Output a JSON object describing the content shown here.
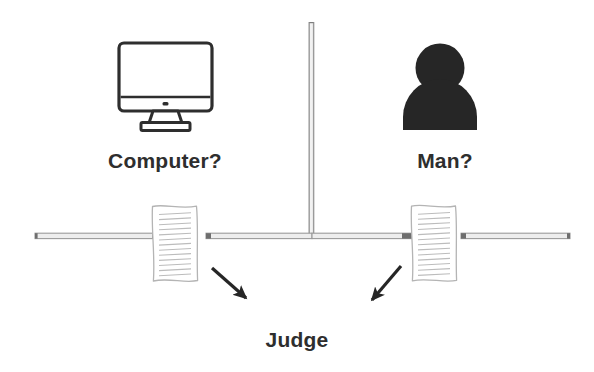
{
  "diagram": {
    "background_color": "#ffffff",
    "width": 594,
    "height": 372
  },
  "labels": {
    "computer": "Computer?",
    "man": "Man?",
    "judge": "Judge"
  },
  "colors": {
    "ink": "#2e2e2e",
    "silhouette": "#262626",
    "wall": "#9a9a9a",
    "wall_cap": "#6e6e6e",
    "paper_outline": "#b4b4b4",
    "paper_rule": "#bcbcbc",
    "arrow": "#262626",
    "background": "#ffffff"
  },
  "icons": {
    "computer": "desktop-monitor-icon",
    "man": "person-silhouette-icon",
    "left_document": "paper-document-icon",
    "right_document": "paper-document-icon",
    "left_arrow": "arrow-down-right-icon",
    "right_arrow": "arrow-down-left-icon"
  },
  "geometry": {
    "wall_horizontal_y": 236,
    "wall_vertical_x": 312,
    "wall_vertical_top": 22,
    "monitor_center_x": 165,
    "person_center_x": 440,
    "left_document_x": 152,
    "right_document_x": 405,
    "document_rule_count": 14
  }
}
